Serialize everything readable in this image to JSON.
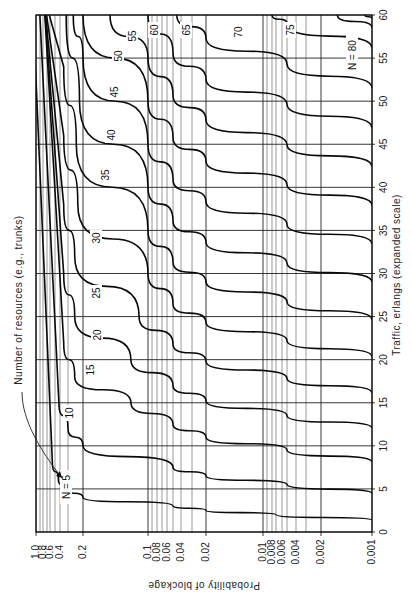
{
  "chart_data": {
    "type": "line",
    "orientation": "rotated-90-clockwise",
    "title": "",
    "xlabel": "Traffic, erlangs (expanded scale)",
    "ylabel": "Probability of blockage",
    "annotation": "Number of resources (e.g., trunks)",
    "x_ticks": [
      "0",
      "5",
      "10",
      "15",
      "20",
      "25",
      "30",
      "35",
      "40",
      "45",
      "50",
      "55",
      "60"
    ],
    "x_range": [
      0,
      60
    ],
    "y_ticks": [
      "1.0",
      "0.8",
      "0.6",
      "0.4",
      "0.2",
      "0.1",
      "0.08",
      "0.06",
      "0.04",
      "0.02",
      "0.01",
      "0.008",
      "0.006",
      "0.004",
      "0.002",
      "0.001"
    ],
    "y_range": [
      0.001,
      1.0
    ],
    "y_scale": "log (expanded)",
    "grid": true,
    "legend": "inline curve labels",
    "series": [
      {
        "name": "N = 5",
        "label": "N = 5",
        "points": [
          [
            1.36,
            0.001
          ],
          [
            2.0,
            0.007
          ],
          [
            2.5,
            0.02
          ],
          [
            3.0,
            0.05
          ],
          [
            4.0,
            0.2
          ],
          [
            5.0,
            0.33
          ],
          [
            6.0,
            0.43
          ],
          [
            8.0,
            0.55
          ]
        ]
      },
      {
        "name": "N = 10",
        "label": "10",
        "points": [
          [
            4.46,
            0.001
          ],
          [
            5.5,
            0.005
          ],
          [
            6.5,
            0.02
          ],
          [
            7.5,
            0.05
          ],
          [
            10.0,
            0.2
          ],
          [
            12.0,
            0.3
          ],
          [
            15.0,
            0.42
          ]
        ]
      },
      {
        "name": "N = 15",
        "label": "15",
        "points": [
          [
            8.11,
            0.001
          ],
          [
            9.5,
            0.005
          ],
          [
            11.0,
            0.02
          ],
          [
            12.5,
            0.05
          ],
          [
            15.0,
            0.12
          ],
          [
            18.0,
            0.25
          ],
          [
            22.0,
            0.35
          ]
        ]
      },
      {
        "name": "N = 20",
        "label": "20",
        "points": [
          [
            12.03,
            0.001
          ],
          [
            13.5,
            0.005
          ],
          [
            15.2,
            0.02
          ],
          [
            17.0,
            0.05
          ],
          [
            20.0,
            0.12
          ],
          [
            25.0,
            0.25
          ],
          [
            30.0,
            0.35
          ]
        ]
      },
      {
        "name": "N = 25",
        "label": "25",
        "points": [
          [
            16.13,
            0.001
          ],
          [
            17.8,
            0.005
          ],
          [
            19.8,
            0.02
          ],
          [
            21.8,
            0.05
          ],
          [
            25.0,
            0.11
          ],
          [
            32.0,
            0.25
          ],
          [
            38.0,
            0.35
          ]
        ]
      },
      {
        "name": "N = 30",
        "label": "30",
        "points": [
          [
            20.34,
            0.001
          ],
          [
            22.2,
            0.005
          ],
          [
            24.3,
            0.02
          ],
          [
            26.5,
            0.05
          ],
          [
            30.0,
            0.1
          ],
          [
            38.0,
            0.23
          ],
          [
            46.0,
            0.35
          ]
        ]
      },
      {
        "name": "N = 35",
        "label": "35",
        "points": [
          [
            24.64,
            0.001
          ],
          [
            26.7,
            0.005
          ],
          [
            29.0,
            0.02
          ],
          [
            31.3,
            0.05
          ],
          [
            35.0,
            0.1
          ],
          [
            45.0,
            0.24
          ],
          [
            54.0,
            0.35
          ]
        ]
      },
      {
        "name": "N = 40",
        "label": "40",
        "points": [
          [
            29.0,
            0.001
          ],
          [
            31.2,
            0.005
          ],
          [
            33.6,
            0.02
          ],
          [
            36.1,
            0.05
          ],
          [
            40.0,
            0.1
          ],
          [
            50.0,
            0.22
          ],
          [
            60.0,
            0.32
          ]
        ]
      },
      {
        "name": "N = 45",
        "label": "45",
        "points": [
          [
            33.4,
            0.001
          ],
          [
            35.7,
            0.005
          ],
          [
            38.3,
            0.02
          ],
          [
            40.9,
            0.05
          ],
          [
            45.0,
            0.1
          ],
          [
            55.0,
            0.2
          ],
          [
            60.0,
            0.26
          ]
        ]
      },
      {
        "name": "N = 50",
        "label": "50",
        "points": [
          [
            37.9,
            0.001
          ],
          [
            40.3,
            0.005
          ],
          [
            43.0,
            0.02
          ],
          [
            45.8,
            0.05
          ],
          [
            50.0,
            0.1
          ],
          [
            60.0,
            0.2
          ]
        ]
      },
      {
        "name": "N = 55",
        "label": "55",
        "points": [
          [
            42.4,
            0.001
          ],
          [
            44.9,
            0.005
          ],
          [
            47.8,
            0.02
          ],
          [
            50.7,
            0.05
          ],
          [
            55.0,
            0.1
          ],
          [
            60.0,
            0.15
          ]
        ]
      },
      {
        "name": "N = 60",
        "label": "60",
        "points": [
          [
            46.9,
            0.001
          ],
          [
            49.6,
            0.005
          ],
          [
            52.5,
            0.02
          ],
          [
            55.6,
            0.05
          ],
          [
            60.0,
            0.1
          ]
        ]
      },
      {
        "name": "N = 65",
        "label": "65",
        "points": [
          [
            51.5,
            0.001
          ],
          [
            54.3,
            0.005
          ],
          [
            57.3,
            0.02
          ],
          [
            60.0,
            0.045
          ]
        ]
      },
      {
        "name": "N = 70",
        "label": "70",
        "points": [
          [
            56.1,
            0.001
          ],
          [
            59.0,
            0.005
          ],
          [
            60.0,
            0.008
          ]
        ]
      },
      {
        "name": "N = 75",
        "label": "75",
        "points": [
          [
            58.5,
            0.001
          ],
          [
            60.0,
            0.0016
          ]
        ]
      },
      {
        "name": "N = 80",
        "label": "N = 80",
        "points": [
          [
            59.6,
            0.001
          ],
          [
            60.0,
            0.0011
          ]
        ]
      }
    ]
  },
  "layout": {
    "plot_left": 36,
    "plot_right": 372,
    "plot_top": 15,
    "plot_bottom": 532,
    "y_tick_px": {
      "1.0": 36,
      "0.9": 40,
      "0.8": 43,
      "0.7": 47,
      "0.6": 50,
      "0.5": 55,
      "0.4": 60,
      "0.3": 68,
      "0.2": 83,
      "0.1": 148,
      "0.09": 152,
      "0.08": 157,
      "0.07": 162,
      "0.06": 167,
      "0.05": 173,
      "0.04": 181,
      "0.03": 192,
      "0.02": 206,
      "0.01": 263,
      "0.009": 267,
      "0.008": 272,
      "0.007": 276,
      "0.006": 282,
      "0.005": 287,
      "0.004": 296,
      "0.003": 306,
      "0.002": 321,
      "0.001": 372
    }
  }
}
